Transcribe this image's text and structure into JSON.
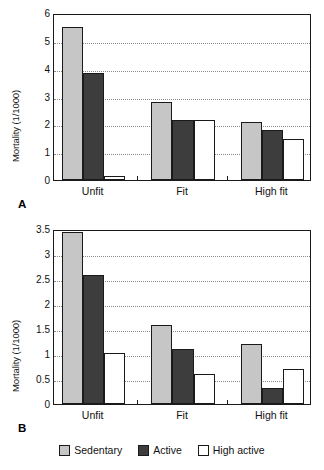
{
  "figure": {
    "panels": [
      {
        "letter": "A",
        "ylabel": "Mortality (1/1000)",
        "yticks": [
          "0",
          "1",
          "2",
          "3",
          "4",
          "5",
          "6"
        ],
        "ytick_values": [
          0,
          1,
          2,
          3,
          4,
          5,
          6
        ],
        "xlabels": [
          "Unfit",
          "Fit",
          "High fit"
        ]
      },
      {
        "letter": "B",
        "ylabel": "Mortality (1/1000)",
        "yticks": [
          "0",
          "0.5",
          "1",
          "1.5",
          "2",
          "2.5",
          "3",
          "3.5"
        ],
        "ytick_values": [
          0,
          0.5,
          1,
          1.5,
          2,
          2.5,
          3,
          3.5
        ],
        "xlabels": [
          "Unfit",
          "Fit",
          "High fit"
        ]
      }
    ]
  },
  "legend": {
    "items": [
      {
        "label": "Sedentary",
        "color": "#c6c6c6",
        "key": "sedentary"
      },
      {
        "label": "Active",
        "color": "#3d3d3d",
        "key": "active"
      },
      {
        "label": "High active",
        "color": "#ffffff",
        "key": "highactive"
      }
    ]
  },
  "chart_data": [
    {
      "type": "bar",
      "panel": "A",
      "title": "",
      "xlabel": "",
      "ylabel": "Mortality (1/1000)",
      "categories": [
        "Unfit",
        "Fit",
        "High fit"
      ],
      "series": [
        {
          "name": "Sedentary",
          "color": "#c6c6c6",
          "values": [
            5.48,
            2.8,
            2.08
          ]
        },
        {
          "name": "Active",
          "color": "#3d3d3d",
          "values": [
            3.84,
            2.17,
            1.8
          ]
        },
        {
          "name": "High active",
          "color": "#ffffff",
          "values": [
            0.15,
            2.17,
            1.49
          ]
        }
      ],
      "ylim": [
        0,
        6
      ],
      "yticks": [
        0,
        1,
        2,
        3,
        4,
        5,
        6
      ],
      "grid": true,
      "legend_position": "bottom"
    },
    {
      "type": "bar",
      "panel": "B",
      "title": "",
      "xlabel": "",
      "ylabel": "Mortality (1/1000)",
      "categories": [
        "Unfit",
        "Fit",
        "High fit"
      ],
      "series": [
        {
          "name": "Sedentary",
          "color": "#c6c6c6",
          "values": [
            3.45,
            1.58,
            1.2
          ]
        },
        {
          "name": "Active",
          "color": "#3d3d3d",
          "values": [
            2.58,
            1.1,
            0.33
          ]
        },
        {
          "name": "High active",
          "color": "#ffffff",
          "values": [
            1.02,
            0.6,
            0.7
          ]
        }
      ],
      "ylim": [
        0,
        3.5
      ],
      "yticks": [
        0,
        0.5,
        1,
        1.5,
        2,
        2.5,
        3,
        3.5
      ],
      "grid": true,
      "legend_position": "bottom"
    }
  ]
}
